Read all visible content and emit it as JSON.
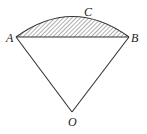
{
  "figure": {
    "type": "sector-with-segment",
    "labels": {
      "A": "A",
      "B": "B",
      "C": "C",
      "O": "O"
    },
    "shaded_region": "segment ACB",
    "line_color": "#333333",
    "hatch_color": "#333333"
  }
}
